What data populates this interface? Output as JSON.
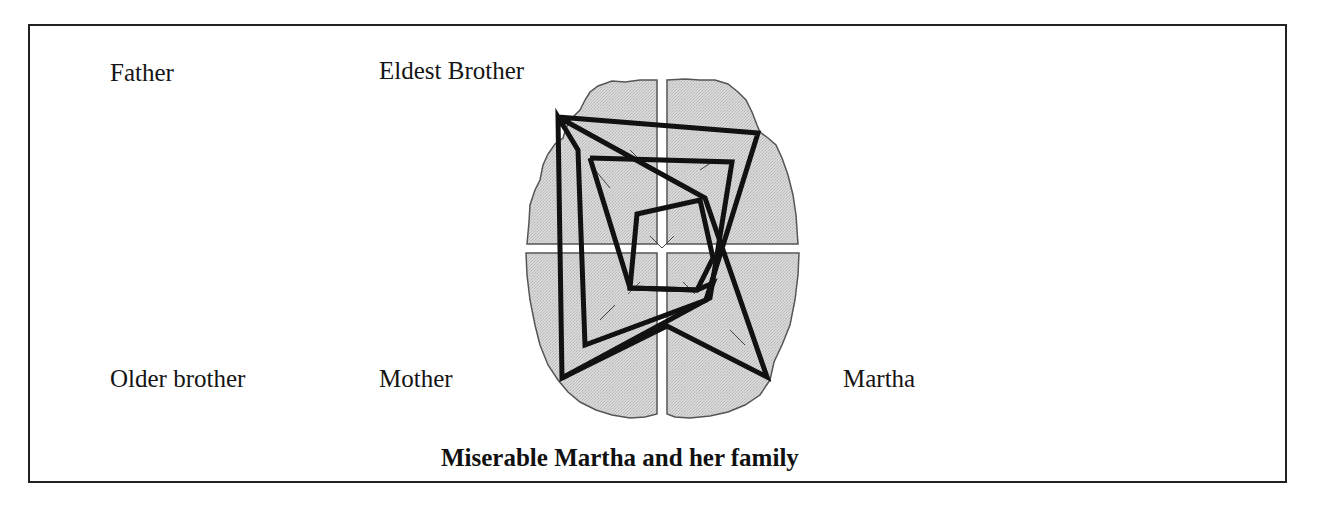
{
  "figure": {
    "title": "Miserable Martha and her family",
    "labels": {
      "father": "Father",
      "eldest_brother": "Eldest Brother",
      "older_brother": "Older brother",
      "mother": "Mother",
      "martha": "Martha"
    },
    "graphic": "brain-outline-with-radar-polygons",
    "colors": {
      "frame": "#222222",
      "brain_fill": "#d4d4d4",
      "brain_outline": "#555555",
      "polygon_stroke": "#111111",
      "text": "#151515"
    }
  }
}
